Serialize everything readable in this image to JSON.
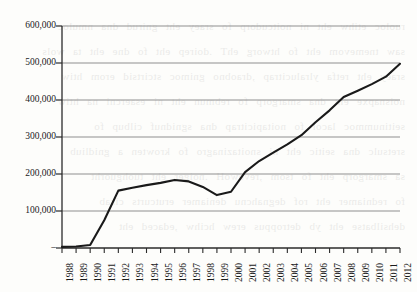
{
  "chart_data": {
    "type": "line",
    "title": "",
    "subtitle": "",
    "xlabel": "",
    "ylabel": "",
    "categories": [
      "1988",
      "1989",
      "1990",
      "1991",
      "1992",
      "1993",
      "1994",
      "1995",
      "1996",
      "1997",
      "1998",
      "1999",
      "2000",
      "2001",
      "2002",
      "2003",
      "2004",
      "2005",
      "2006",
      "2007",
      "2008",
      "2009",
      "2010",
      "2011",
      "2012"
    ],
    "series": [
      {
        "name": "",
        "values": [
          3000,
          4000,
          8000,
          75000,
          155000,
          163000,
          170000,
          176000,
          184000,
          180000,
          165000,
          143000,
          152000,
          205000,
          235000,
          258000,
          280000,
          305000,
          340000,
          372000,
          408000,
          425000,
          443000,
          463000,
          498000
        ]
      }
    ],
    "ytick_labels": [
      "600,000",
      "500,000",
      "400,000",
      "300,000",
      "200,000",
      "100,000",
      "–"
    ],
    "ytick_values": [
      600000,
      500000,
      400000,
      300000,
      200000,
      100000,
      0
    ],
    "ylim": [
      0,
      600000
    ],
    "grid": "horizontal",
    "legend": "none",
    "line_color": "#1a1a1a",
    "grid_color": "#9a9a9a",
    "axis_color": "#2b2b2b",
    "background": "#fdfdfb"
  },
  "bleed_text": "ruoloc etihw eht ni noitcudorp fo sraey eht gnirud dna nmuloc\nsaw tnemevom eht fo htworg ehT .doirep eht fo dne eht ta wols\nsraey eht retfa ylralucitrap ,draobno gnimoc stcirtsid erom htiw\nnoisnapxe eht dna smargorp fo rebmun eht ni esaercni na htiw\nseitinummoc lacol fo noitapicitrap dna sgnidnuf cilbup fo\nsretsulc dna seitic eht ni snoitazinagro fo krowten a gnidliub\nsa smargorp eht fo tsom ,revewoH .noiger eht tuohguorht\nfo redniamer eht rof degnahcnu deniamer erutcurts cisab\ndehsilbatse eht yb detroppus erew hcihw ,edaced eht"
}
